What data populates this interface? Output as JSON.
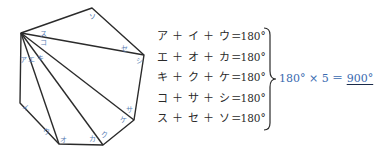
{
  "figure": {
    "stroke_color": "#2b2b2b",
    "label_color": "#5a7fb5",
    "angle_labels": [
      {
        "id": "a",
        "text": "ア"
      },
      {
        "id": "i",
        "text": "イ"
      },
      {
        "id": "u",
        "text": "ウ"
      },
      {
        "id": "e",
        "text": "エ"
      },
      {
        "id": "o",
        "text": "オ"
      },
      {
        "id": "ka",
        "text": "カ"
      },
      {
        "id": "ki",
        "text": "キ"
      },
      {
        "id": "ku",
        "text": "ク"
      },
      {
        "id": "ke",
        "text": "ケ"
      },
      {
        "id": "ko",
        "text": "コ"
      },
      {
        "id": "sa",
        "text": "サ"
      },
      {
        "id": "shi",
        "text": "シ"
      },
      {
        "id": "su",
        "text": "ス"
      },
      {
        "id": "se",
        "text": "セ"
      },
      {
        "id": "so",
        "text": "ソ"
      }
    ]
  },
  "equations": [
    {
      "lhs": "ア ＋ イ ＋ ウ",
      "rhs": "＝180°"
    },
    {
      "lhs": "エ ＋ オ ＋ カ",
      "rhs": "＝180°"
    },
    {
      "lhs": "キ ＋ ク ＋ ケ",
      "rhs": "＝180°"
    },
    {
      "lhs": "コ ＋ サ ＋ シ",
      "rhs": "＝180°"
    },
    {
      "lhs": "ス ＋ セ ＋ ソ",
      "rhs": "＝180°"
    }
  ],
  "result": {
    "expression": "180° × 5 ＝ ",
    "answer": "900°",
    "color": "#3a6ab0"
  }
}
